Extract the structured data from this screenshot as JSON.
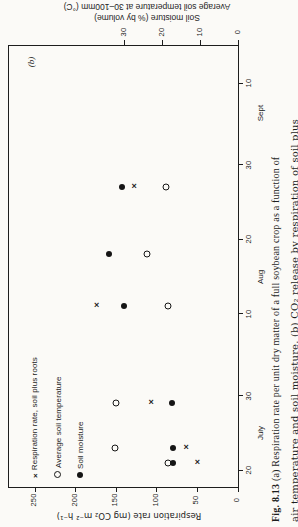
{
  "page": {
    "panel_label": "(b)"
  },
  "caption": {
    "fig_label": "Fig. 8.13",
    "line1_rest": "  (a) Respiration rate per unit dry matter of a full soybean crop as a function of",
    "line2": "air temperature and soil moisture. (b) CO₂ release by respiration of soil plus"
  },
  "legend": {
    "items": [
      {
        "marker": "x",
        "label": "Respiration rate, soil plus roots"
      },
      {
        "marker": "o",
        "label": "Average soil temperature"
      },
      {
        "marker": "dot",
        "label": "Soil moisture"
      }
    ]
  },
  "chart_data": {
    "type": "scatter",
    "value_axis_bottom": {
      "title": "Respiration rate (mg CO₂ m⁻² h⁻¹)",
      "ticks": [
        250,
        200,
        150,
        100,
        50,
        0
      ],
      "range": [
        0,
        283
      ],
      "direction": "zero-at-right"
    },
    "value_axis_top": {
      "title_line1": "Soil moisture (% by volume)",
      "title_line2": "Average soil temperature at 30–100mm (°C)",
      "ticks": [
        30,
        20,
        10,
        0
      ],
      "range": [
        0,
        60
      ],
      "direction": "zero-at-right"
    },
    "date_axis_right": {
      "ticks": [
        {
          "t": 201,
          "label": "20"
        },
        {
          "t": 211,
          "label": "30"
        },
        {
          "t": 222,
          "label": "10"
        },
        {
          "t": 232,
          "label": "20"
        },
        {
          "t": 242,
          "label": "30"
        },
        {
          "t": 253,
          "label": "10"
        }
      ],
      "months": [
        {
          "t": 206,
          "label": "July"
        },
        {
          "t": 227,
          "label": "Aug"
        },
        {
          "t": 249,
          "label": "Sept"
        }
      ],
      "range_note": "time increases upward, ~18 July (bottom) to ~15 Sept (top)"
    },
    "series": [
      {
        "name": "Respiration rate, soil plus roots",
        "marker": "x",
        "axis": "respiration",
        "points": [
          {
            "date": "21 July",
            "t": 202,
            "value": 50
          },
          {
            "date": "23 July",
            "t": 204,
            "value": 64
          },
          {
            "date": "29 July",
            "t": 210,
            "value": 107
          },
          {
            "date": "11 Aug",
            "t": 223,
            "value": 174
          },
          {
            "date": "27 Aug",
            "t": 239,
            "value": 128
          }
        ]
      },
      {
        "name": "Average soil temperature",
        "marker": "o",
        "axis": "soil",
        "points": [
          {
            "date": "21 July",
            "t": 202,
            "value": 18.5
          },
          {
            "date": "23 July",
            "t": 204,
            "value": 32.5
          },
          {
            "date": "29 July",
            "t": 210,
            "value": 32
          },
          {
            "date": "11 Aug",
            "t": 223,
            "value": 18.5
          },
          {
            "date": "18 Aug",
            "t": 230,
            "value": 24
          },
          {
            "date": "27 Aug",
            "t": 239,
            "value": 19
          }
        ]
      },
      {
        "name": "Soil moisture",
        "marker": "dot",
        "axis": "soil",
        "points": [
          {
            "date": "21 July",
            "t": 202,
            "value": 17
          },
          {
            "date": "23 July",
            "t": 204,
            "value": 17
          },
          {
            "date": "29 July",
            "t": 210,
            "value": 17.5
          },
          {
            "date": "11 Aug",
            "t": 223,
            "value": 30
          },
          {
            "date": "18 Aug",
            "t": 230,
            "value": 34
          },
          {
            "date": "27 Aug",
            "t": 239,
            "value": 30.5
          }
        ]
      }
    ]
  }
}
